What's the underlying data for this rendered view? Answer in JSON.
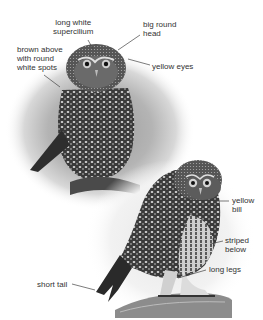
{
  "figure": {
    "style": "grayscale photographic illustration",
    "labels": {
      "supercilium": "long white\nsupercilium",
      "head": "big round\nhead",
      "upperparts": "brown above\nwith round\nwhite spots",
      "eyes": "yellow eyes",
      "bill": "yellow\nbill",
      "underparts": "striped\nbelow",
      "legs": "long legs",
      "tail": "short tail"
    },
    "colors": {
      "label_text": "#333333",
      "leader_line": "#444444",
      "background": "#ffffff"
    }
  }
}
